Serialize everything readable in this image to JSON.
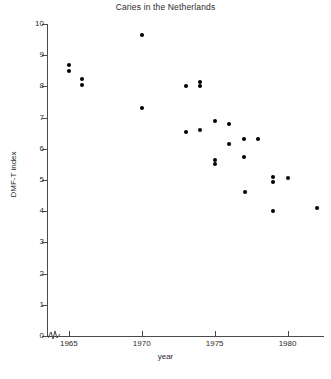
{
  "chart_data": {
    "type": "scatter",
    "title": "Caries in the Netherlands",
    "xlabel": "year",
    "ylabel": "DMF-T index",
    "xlim": [
      1963.5,
      1982.5
    ],
    "ylim": [
      0,
      10
    ],
    "xticks": [
      1965,
      1970,
      1975,
      1980
    ],
    "yticks": [
      0,
      1,
      2,
      3,
      4,
      5,
      6,
      7,
      8,
      9,
      10
    ],
    "grid": false,
    "legend": null,
    "axis_break": "y-axis broken near origin",
    "points": [
      {
        "x": 1965.0,
        "y": 8.7
      },
      {
        "x": 1965.0,
        "y": 8.5
      },
      {
        "x": 1965.9,
        "y": 8.25
      },
      {
        "x": 1965.9,
        "y": 8.05
      },
      {
        "x": 1970.0,
        "y": 9.65
      },
      {
        "x": 1970.0,
        "y": 7.3
      },
      {
        "x": 1973.0,
        "y": 8.0
      },
      {
        "x": 1973.0,
        "y": 6.55
      },
      {
        "x": 1974.0,
        "y": 8.15
      },
      {
        "x": 1974.0,
        "y": 8.0
      },
      {
        "x": 1974.0,
        "y": 6.6
      },
      {
        "x": 1975.0,
        "y": 6.9
      },
      {
        "x": 1975.0,
        "y": 5.65
      },
      {
        "x": 1975.0,
        "y": 5.5
      },
      {
        "x": 1976.0,
        "y": 6.8
      },
      {
        "x": 1976.0,
        "y": 6.15
      },
      {
        "x": 1977.0,
        "y": 6.3
      },
      {
        "x": 1977.0,
        "y": 5.75
      },
      {
        "x": 1977.1,
        "y": 4.6
      },
      {
        "x": 1978.0,
        "y": 6.3
      },
      {
        "x": 1979.0,
        "y": 5.1
      },
      {
        "x": 1979.0,
        "y": 4.95
      },
      {
        "x": 1979.0,
        "y": 4.0
      },
      {
        "x": 1980.0,
        "y": 5.05
      },
      {
        "x": 1982.0,
        "y": 4.1
      }
    ]
  },
  "caption": ""
}
